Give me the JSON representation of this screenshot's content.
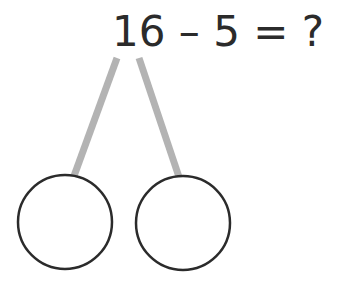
{
  "equation": {
    "text": "16 – 5 = ?",
    "minuend": "16",
    "operator": "–",
    "subtrahend": "5",
    "equals": "=",
    "unknown": "?"
  },
  "number_bond": {
    "parts": [
      {
        "label": "",
        "value": ""
      },
      {
        "label": "",
        "value": ""
      }
    ],
    "connector_color": "#b3b3b3",
    "circle_stroke_color": "#2b2b2b"
  }
}
